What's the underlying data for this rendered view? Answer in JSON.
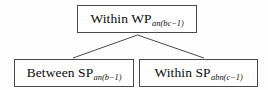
{
  "diagram": {
    "type": "tree",
    "orientation": "top-down",
    "background_color": "#fefefe",
    "border_color": "#4a4a4a",
    "text_color": "#0b0b0b",
    "nodes": {
      "root": {
        "main_text": "Within WP",
        "subscript": "an(bc−1)"
      },
      "child_left": {
        "main_text": "Between SP",
        "subscript": "an(b−1)"
      },
      "child_right": {
        "main_text": "Within SP",
        "subscript": "abn(c−1)"
      }
    },
    "edges": [
      {
        "from": "root",
        "to": "child_left"
      },
      {
        "from": "root",
        "to": "child_right"
      }
    ]
  }
}
